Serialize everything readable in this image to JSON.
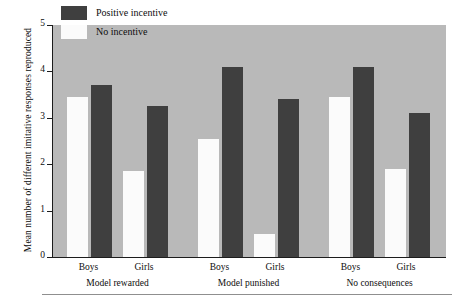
{
  "chart_data": {
    "type": "bar",
    "title": "",
    "xlabel": "",
    "ylabel": "Mean number of different imitative responses reproduced",
    "ylim": [
      0,
      5
    ],
    "yticks": [
      "0",
      "1",
      "2",
      "3",
      "4",
      "5"
    ],
    "grid": false,
    "legend_position": "top-left-inside",
    "categories": [
      "Boys",
      "Girls",
      "Boys",
      "Girls",
      "Boys",
      "Girls"
    ],
    "groups": [
      {
        "label": "Model rewarded",
        "categories": [
          "Boys",
          "Girls"
        ]
      },
      {
        "label": "Model punished",
        "categories": [
          "Boys",
          "Girls"
        ]
      },
      {
        "label": "No consequences",
        "categories": [
          "Boys",
          "Girls"
        ]
      }
    ],
    "series": [
      {
        "name": "No incentive",
        "color": "#fbfbfb",
        "values": [
          3.45,
          1.85,
          2.55,
          0.5,
          3.45,
          1.9
        ]
      },
      {
        "name": "Positive incentive",
        "color": "#3f3f3f",
        "values": [
          3.7,
          3.25,
          4.1,
          3.4,
          4.1,
          3.1
        ]
      }
    ]
  },
  "legend": {
    "items": [
      {
        "label": "Positive incentive",
        "swatch": "dark"
      },
      {
        "label": "No incentive",
        "swatch": "light"
      }
    ]
  },
  "colors": {
    "plot_background": "#b9b9b9",
    "dark_bar": "#3f3f3f",
    "light_bar": "#fbfbfb",
    "axis": "#1c1c1c",
    "text": "#0d0d0d"
  }
}
